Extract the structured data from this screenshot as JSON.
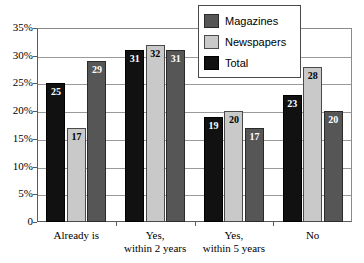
{
  "chart_data": {
    "type": "bar",
    "title": "",
    "subtitle": "",
    "xlabel": "",
    "ylabel": "",
    "grid": true,
    "legend_position": "top-right",
    "categories": [
      "Already is",
      "Yes,\nwithin 2 years",
      "Yes,\nwithin 5 years",
      "No"
    ],
    "category_lines": [
      [
        "Already is"
      ],
      [
        "Yes,",
        "within 2 years"
      ],
      [
        "Yes,",
        "within 5 years"
      ],
      [
        "No"
      ]
    ],
    "series": [
      {
        "name": "Total",
        "color": "#111111",
        "values": [
          25,
          31,
          19,
          23
        ]
      },
      {
        "name": "Newspapers",
        "color": "#c9c9c9",
        "values": [
          17,
          32,
          20,
          28
        ]
      },
      {
        "name": "Magazines",
        "color": "#565656",
        "values": [
          29,
          31,
          17,
          20
        ]
      }
    ],
    "series_draw_order": [
      "Total",
      "Newspapers",
      "Magazines"
    ],
    "ylim": [
      0,
      35
    ],
    "ytick_values": [
      0,
      5,
      10,
      15,
      20,
      25,
      30,
      35
    ],
    "ytick_labels": [
      "0",
      "5%",
      "10%",
      "15%",
      "20%",
      "25%",
      "30%",
      "35%"
    ],
    "value_labels": {
      "Already is": {
        "Total": "25",
        "Newspapers": "17",
        "Magazines": "29"
      },
      "Yes, within 2 years": {
        "Total": "31",
        "Newspapers": "32",
        "Magazines": "31"
      },
      "Yes, within 5 years": {
        "Total": "19",
        "Newspapers": "20",
        "Magazines": "17"
      },
      "No": {
        "Total": "23",
        "Newspapers": "28",
        "Magazines": "20"
      }
    }
  },
  "legend": {
    "items": [
      {
        "label": "Magazines",
        "swatch": "magazines"
      },
      {
        "label": "Newspapers",
        "swatch": "newspapers"
      },
      {
        "label": "Total",
        "swatch": "total"
      }
    ]
  }
}
